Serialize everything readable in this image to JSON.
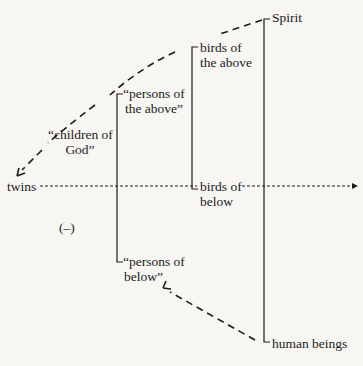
{
  "diagram": {
    "title": "",
    "nodes": {
      "spirit": "Spirit",
      "birds_above_1": "birds of",
      "birds_above_2": "the above",
      "persons_above_1": "“persons of",
      "persons_above_2": "the above”",
      "children_1": "“children of",
      "children_2": "God”",
      "twins": "twins",
      "birds_below_1": "birds of",
      "birds_below_2": "below",
      "minus": "(–)",
      "persons_below_1": "“persons of",
      "persons_below_2": "below”",
      "human": "human beings"
    },
    "colors": {
      "ink": "#1c1c1c",
      "paper": "#f7f6f3"
    }
  }
}
